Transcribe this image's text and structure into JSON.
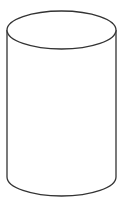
{
  "diagram": {
    "shape": "cylinder",
    "stroke_color": "#333333",
    "fill_color": "#ffffff",
    "background": "#ffffff",
    "geometry": {
      "left_x": 7,
      "right_x": 116,
      "top_center_y": 30,
      "bottom_center_y": 177,
      "ellipse_ry": 19,
      "stroke_width": 1.3
    }
  }
}
